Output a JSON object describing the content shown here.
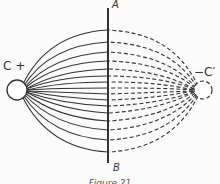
{
  "figure": {
    "labels": {
      "a": "A",
      "b": "B",
      "c": "C +",
      "c_prime": "−C′"
    },
    "caption": "Figure 21",
    "colors": {
      "line": "#333333",
      "background": "#fbfbfb"
    },
    "elements": {
      "left_charge": "positive charge C (solid circle)",
      "right_charge": "negative image charge C' (dashed circle)",
      "plane": "conducting plane AB (vertical line)",
      "field_lines_left": "solid field lines",
      "field_lines_right": "dashed image field lines"
    }
  }
}
